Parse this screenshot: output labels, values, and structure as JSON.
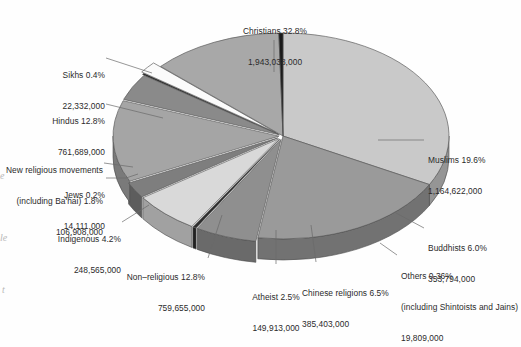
{
  "chart_data": {
    "type": "pie",
    "title": "",
    "subtitle": "",
    "xlabel": "",
    "ylabel": "",
    "legend_position": "callout-labels",
    "grid": false,
    "units": "adherents",
    "categories": [
      "Christians",
      "Muslims",
      "Buddhists",
      "Others (including Shintoists and Jains)",
      "Chinese religions",
      "Atheist",
      "Non-religious",
      "Indigenous",
      "Jews",
      "New religious movements (including Ba'hai)",
      "Hindus",
      "Sikhs"
    ],
    "percentages": [
      32.8,
      19.6,
      6.0,
      0.36,
      6.5,
      2.5,
      12.8,
      4.2,
      0.2,
      1.8,
      12.8,
      0.4
    ],
    "values": [
      1943038000,
      1164622000,
      353794000,
      19809000,
      385403000,
      149913000,
      759655000,
      248565000,
      14111000,
      106908000,
      761689000,
      22332000
    ]
  },
  "slices": [
    {
      "key": "christians",
      "name": "Christians",
      "pct": "32.8%",
      "value": "1,943,038,000",
      "label_line1": "Christians 32.8%",
      "label_line2": "1,943,038,000",
      "color": "#c9c9c9"
    },
    {
      "key": "muslims",
      "name": "Muslims",
      "pct": "19.6%",
      "value": "1,164,622,000",
      "label_line1": "Muslims 19.6%",
      "label_line2": "1,164,622,000",
      "color": "#9a9a9a"
    },
    {
      "key": "buddhists",
      "name": "Buddhists",
      "pct": "6.0%",
      "value": "353,794,000",
      "label_line1": "Buddhists 6.0%",
      "label_line2": "353,794,000",
      "color": "#8f8f8f"
    },
    {
      "key": "others",
      "name": "Others (including Shintoists and Jains)",
      "pct": "0.36%",
      "value": "19,809,000",
      "label_line1": "Others 0.36%",
      "label_line2": "(including Shintoists and Jains)",
      "label_line3": "19,809,000",
      "color": "#2e2e2e"
    },
    {
      "key": "chinese-religions",
      "name": "Chinese religions",
      "pct": "6.5%",
      "value": "385,403,000",
      "label_line1": "Chinese religions 6.5%",
      "label_line2": "385,403,000",
      "color": "#d9d9d9"
    },
    {
      "key": "atheist",
      "name": "Atheist",
      "pct": "2.5%",
      "value": "149,913,000",
      "label_line1": "Atheist 2.5%",
      "label_line2": "149,913,000",
      "color": "#7e7e7e"
    },
    {
      "key": "non-religious",
      "name": "Non-religious",
      "pct": "12.8%",
      "value": "759,655,000",
      "label_line1": "Non–religious 12.8%",
      "label_line2": "759,655,000",
      "color": "#a5a5a5"
    },
    {
      "key": "indigenous",
      "name": "Indigenous",
      "pct": "4.2%",
      "value": "248,565,000",
      "label_line1": "Indigenous 4.2%",
      "label_line2": "248,565,000",
      "color": "#8a8a8a"
    },
    {
      "key": "jews",
      "name": "Jews",
      "pct": "0.2%",
      "value": "14,111,000",
      "label_line1": "Jews 0.2%",
      "label_line2": "14,111,000",
      "color": "#222222"
    },
    {
      "key": "new-religious-movements",
      "name": "New religious movements (including Ba'hai)",
      "pct": "1.8%",
      "value": "106,908,000",
      "label_line1": "New religious movements",
      "label_line2": "(including Ba'hai) 1.8%",
      "label_line3": "106,908,000",
      "color": "#fbfbfb"
    },
    {
      "key": "hindus",
      "name": "Hindus",
      "pct": "12.8%",
      "value": "761,689,000",
      "label_line1": "Hindus 12.8%",
      "label_line2": "761,689,000",
      "color": "#a8a8a8"
    },
    {
      "key": "sikhs",
      "name": "Sikhs",
      "pct": "0.4%",
      "value": "22,332,000",
      "label_line1": "Sikhs 0.4%",
      "label_line2": "22,332,000",
      "color": "#1a1a1a"
    }
  ],
  "margin_bleed": {
    "mark1": "e",
    "mark2": "le",
    "mark3": "t"
  }
}
